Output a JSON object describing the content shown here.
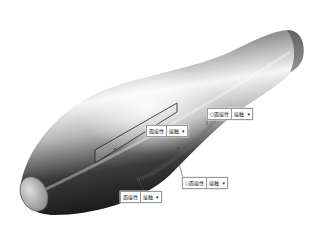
{
  "figure": {
    "colors": {
      "background": "#ffffff",
      "surface_dark": "#1a1a1a",
      "surface_light": "#f2f2f2",
      "callout_border": "#9a9a9a"
    }
  },
  "callouts": [
    {
      "prefix": "",
      "label": "面接性",
      "value": "接触",
      "dropdown_icon": "chevron-down-icon"
    },
    {
      "prefix": "○",
      "label": "面接性",
      "value": "接触",
      "dropdown_icon": "chevron-down-icon"
    },
    {
      "prefix": "○",
      "label": "面接性",
      "value": "接触",
      "dropdown_icon": "chevron-down-icon"
    },
    {
      "prefix": "",
      "label": "面接性",
      "value": "接触",
      "dropdown_icon": "chevron-down-icon"
    }
  ]
}
